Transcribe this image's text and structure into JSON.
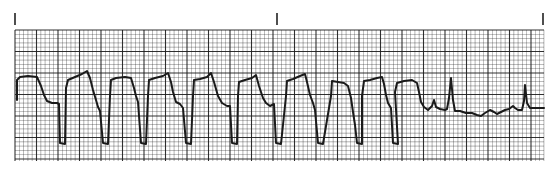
{
  "strip": {
    "type": "ecg-rhythm-strip",
    "paper": {
      "background": "#ffffff",
      "grid_color": "#1a1a1a",
      "trace_color": "#1a1a1a",
      "left": 15,
      "top": 30,
      "right": 544,
      "bottom": 161,
      "minor_px": 4.3,
      "major_every": 5
    },
    "markers": [
      {
        "x": 15,
        "y1": 13,
        "y2": 25
      },
      {
        "x": 277,
        "y1": 13,
        "y2": 25
      },
      {
        "x": 543,
        "y1": 13,
        "y2": 25
      }
    ],
    "trace_points": [
      [
        17,
        100
      ],
      [
        17,
        80
      ],
      [
        20,
        77
      ],
      [
        28,
        76
      ],
      [
        37,
        77
      ],
      [
        41,
        86
      ],
      [
        44,
        95
      ],
      [
        47,
        101
      ],
      [
        52,
        103
      ],
      [
        57,
        103
      ],
      [
        59,
        104
      ],
      [
        60,
        143
      ],
      [
        65,
        144
      ],
      [
        66,
        88
      ],
      [
        68,
        80
      ],
      [
        75,
        77
      ],
      [
        82,
        74
      ],
      [
        87,
        71
      ],
      [
        90,
        78
      ],
      [
        93,
        90
      ],
      [
        96,
        100
      ],
      [
        98,
        107
      ],
      [
        100,
        111
      ],
      [
        103,
        143
      ],
      [
        108,
        144
      ],
      [
        110,
        96
      ],
      [
        111,
        80
      ],
      [
        116,
        78
      ],
      [
        125,
        77
      ],
      [
        131,
        78
      ],
      [
        134,
        88
      ],
      [
        136,
        96
      ],
      [
        138,
        102
      ],
      [
        141,
        143
      ],
      [
        146,
        144
      ],
      [
        148,
        96
      ],
      [
        149,
        80
      ],
      [
        155,
        78
      ],
      [
        163,
        76
      ],
      [
        168,
        73
      ],
      [
        171,
        82
      ],
      [
        173,
        92
      ],
      [
        176,
        102
      ],
      [
        180,
        104
      ],
      [
        183,
        108
      ],
      [
        186,
        143
      ],
      [
        191,
        144
      ],
      [
        193,
        96
      ],
      [
        194,
        80
      ],
      [
        200,
        79
      ],
      [
        207,
        77
      ],
      [
        211,
        73
      ],
      [
        214,
        82
      ],
      [
        218,
        96
      ],
      [
        222,
        103
      ],
      [
        227,
        106
      ],
      [
        230,
        106
      ],
      [
        232,
        143
      ],
      [
        237,
        144
      ],
      [
        238,
        96
      ],
      [
        239,
        82
      ],
      [
        245,
        80
      ],
      [
        252,
        78
      ],
      [
        256,
        75
      ],
      [
        259,
        86
      ],
      [
        263,
        98
      ],
      [
        266,
        103
      ],
      [
        270,
        106
      ],
      [
        274,
        104
      ],
      [
        276,
        143
      ],
      [
        281,
        144
      ],
      [
        286,
        96
      ],
      [
        287,
        81
      ],
      [
        293,
        79
      ],
      [
        300,
        76
      ],
      [
        305,
        74
      ],
      [
        307,
        82
      ],
      [
        310,
        95
      ],
      [
        313,
        103
      ],
      [
        315,
        110
      ],
      [
        318,
        143
      ],
      [
        323,
        144
      ],
      [
        331,
        96
      ],
      [
        332,
        81
      ],
      [
        338,
        82
      ],
      [
        344,
        83
      ],
      [
        348,
        86
      ],
      [
        351,
        98
      ],
      [
        353,
        112
      ],
      [
        355,
        125
      ],
      [
        357,
        143
      ],
      [
        362,
        144
      ],
      [
        362,
        96
      ],
      [
        364,
        81
      ],
      [
        370,
        80
      ],
      [
        377,
        78
      ],
      [
        382,
        77
      ],
      [
        384,
        84
      ],
      [
        386,
        95
      ],
      [
        388,
        103
      ],
      [
        391,
        108
      ],
      [
        393,
        143
      ],
      [
        398,
        144
      ],
      [
        395,
        92
      ],
      [
        397,
        83
      ],
      [
        404,
        81
      ],
      [
        412,
        80
      ],
      [
        417,
        83
      ],
      [
        419,
        92
      ],
      [
        421,
        102
      ],
      [
        424,
        107
      ],
      [
        428,
        110
      ],
      [
        432,
        106
      ],
      [
        434,
        100
      ],
      [
        436,
        107
      ],
      [
        440,
        109
      ],
      [
        445,
        110
      ],
      [
        447,
        109
      ],
      [
        449,
        98
      ],
      [
        451,
        78
      ],
      [
        453,
        100
      ],
      [
        455,
        111
      ],
      [
        460,
        111
      ],
      [
        466,
        113
      ],
      [
        472,
        113
      ],
      [
        477,
        115
      ],
      [
        481,
        116
      ],
      [
        485,
        113
      ],
      [
        490,
        110
      ],
      [
        494,
        112
      ],
      [
        497,
        114
      ],
      [
        501,
        112
      ],
      [
        505,
        110
      ],
      [
        509,
        109
      ],
      [
        513,
        106
      ],
      [
        515,
        108
      ],
      [
        518,
        110
      ],
      [
        522,
        110
      ],
      [
        524,
        101
      ],
      [
        525,
        85
      ],
      [
        527,
        103
      ],
      [
        530,
        108
      ],
      [
        536,
        108
      ],
      [
        544,
        108
      ]
    ]
  }
}
